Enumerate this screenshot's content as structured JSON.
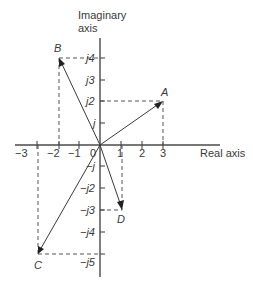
{
  "axes": {
    "imaginary_label_line1": "Imaginary",
    "imaginary_label_line2": "axis",
    "real_label": "Real axis",
    "real_ticks": [
      {
        "value": -3,
        "label": "−3"
      },
      {
        "value": -2,
        "label": "−2"
      },
      {
        "value": -1,
        "label": "−1"
      },
      {
        "value": 0,
        "label": "0"
      },
      {
        "value": 1,
        "label": "1"
      },
      {
        "value": 2,
        "label": "2"
      },
      {
        "value": 3,
        "label": "3"
      }
    ],
    "imag_ticks": [
      {
        "value": 4,
        "label": "j4"
      },
      {
        "value": 3,
        "label": "j3"
      },
      {
        "value": 2,
        "label": "j2"
      },
      {
        "value": 1,
        "label": "j"
      },
      {
        "value": -1,
        "label": "−j"
      },
      {
        "value": -2,
        "label": "−j2"
      },
      {
        "value": -3,
        "label": "−j3"
      },
      {
        "value": -4,
        "label": "−j4"
      },
      {
        "value": -5,
        "label": "−j5"
      }
    ]
  },
  "phasors": [
    {
      "name": "A",
      "real": 3,
      "imag": 2
    },
    {
      "name": "B",
      "real": -2,
      "imag": 4
    },
    {
      "name": "C",
      "real": -3,
      "imag": -5
    },
    {
      "name": "D",
      "real": 1.2,
      "imag": -3
    }
  ],
  "colors": {
    "line": "#3a3a3a",
    "background": "#ffffff"
  }
}
